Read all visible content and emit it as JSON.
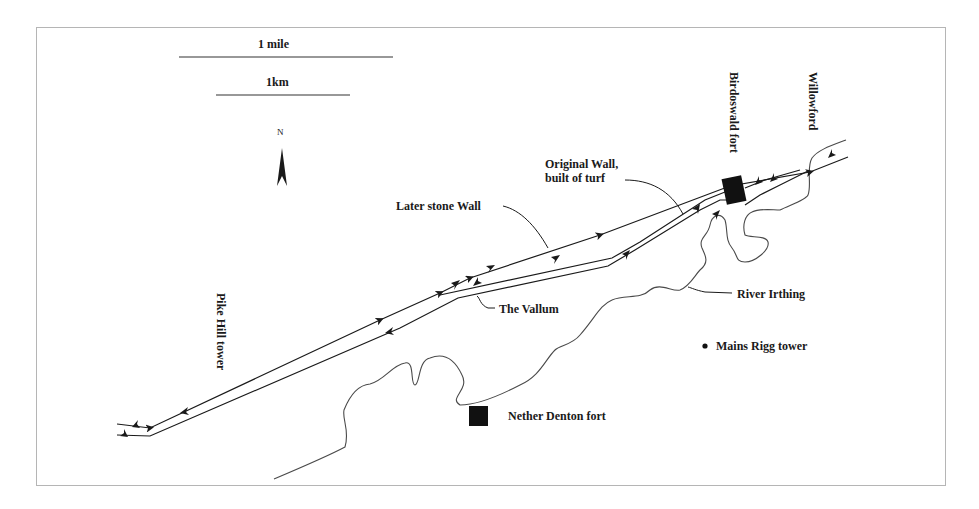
{
  "figure": {
    "type": "map"
  },
  "scale_bar": {
    "mile_label": "1 mile",
    "km_label": "1km"
  },
  "north_arrow": {
    "label": "N"
  },
  "labels": {
    "birdoswald": "Birdoswald fort",
    "willowford": "Willowford",
    "original_wall_line1": "Original Wall,",
    "original_wall_line2": "built of turf",
    "later_stone_wall": "Later stone Wall",
    "vallum": "The Vallum",
    "river": "River Irthing",
    "mains_rigg": "Mains Rigg tower",
    "pike_hill": "Pike Hill tower",
    "nether_denton": "Nether Denton fort"
  },
  "colors": {
    "line": "#1a1a1a",
    "river": "#4a4a4a",
    "frame": "#b5b5b5",
    "background": "#ffffff"
  }
}
